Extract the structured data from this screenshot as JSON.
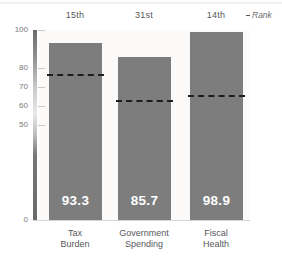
{
  "chart_data": {
    "type": "bar",
    "title": "",
    "subtitle": "",
    "xlabel": "",
    "ylabel": "",
    "ylim": [
      0,
      100
    ],
    "grid": false,
    "legend_position": "top-right",
    "categories": [
      "Tax Burden",
      "Government Spending",
      "Fiscal Health"
    ],
    "category_lines": [
      [
        "Tax",
        "Burden"
      ],
      [
        "Government",
        "Spending"
      ],
      [
        "Fiscal",
        "Health"
      ]
    ],
    "series": [
      {
        "name": "Score",
        "values": [
          93.3,
          85.7,
          98.9
        ],
        "value_labels": [
          "93.3",
          "85.7",
          "98.9"
        ],
        "color": "#7d7d7d"
      },
      {
        "name": "Rank",
        "type": "reference-dashed-line",
        "values": [
          77.0,
          63.0,
          66.0
        ],
        "color": "#1d1d1d"
      }
    ],
    "rank_labels": [
      "15th",
      "31st",
      "14th"
    ],
    "y_ticks": [
      100,
      80,
      70,
      60,
      50,
      0
    ],
    "y_tick_labels": [
      "100",
      "80",
      "70",
      "60",
      "50",
      "0"
    ]
  },
  "legend": {
    "rank_label": "Rank"
  },
  "colors": {
    "bar": "#7d7d7d",
    "dashed_line": "#1d1d1d",
    "plot_background": "#fbfaf9",
    "page_background": "#ffffff",
    "text": "#58585a",
    "tick_text": "#77777a"
  }
}
